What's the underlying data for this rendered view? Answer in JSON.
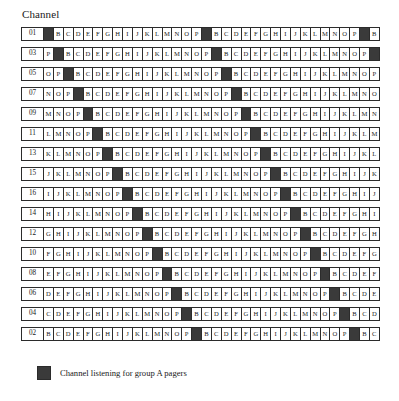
{
  "figure": {
    "axis_title": "Channel",
    "marked_symbol": "A",
    "marked_color": "#3a3a3a",
    "line_color": "#2b2b2b",
    "background_color": "#ffffff"
  },
  "legend": {
    "swatch_color": "#3a3a3a",
    "text": "Channel listening for group A pagers"
  },
  "chart_data": {
    "type": "table",
    "title": "Channel",
    "xlabel": "",
    "ylabel": "Channel",
    "slot_alphabet": [
      "A",
      "B",
      "C",
      "D",
      "E",
      "F",
      "G",
      "H",
      "I",
      "J",
      "K",
      "L",
      "M",
      "N",
      "O",
      "P"
    ],
    "marked_slot": "A",
    "row_order": [
      "01",
      "03",
      "05",
      "07",
      "09",
      "11",
      "13",
      "15",
      "16",
      "14",
      "12",
      "10",
      "08",
      "06",
      "04",
      "02"
    ],
    "rows": [
      {
        "channel": "01",
        "start_offset": 0,
        "slots": [
          "A",
          "B",
          "C",
          "D",
          "E",
          "F",
          "G",
          "H",
          "I",
          "J",
          "K",
          "L",
          "M",
          "N",
          "O",
          "P",
          "A",
          "B",
          "C",
          "D",
          "E",
          "F",
          "G",
          "H",
          "I",
          "J",
          "K",
          "L",
          "M",
          "N",
          "O",
          "P",
          "A",
          "B"
        ]
      },
      {
        "channel": "03",
        "start_offset": 15,
        "slots": [
          "P",
          "A",
          "B",
          "C",
          "D",
          "E",
          "F",
          "G",
          "H",
          "I",
          "J",
          "K",
          "L",
          "M",
          "N",
          "O",
          "P",
          "A",
          "B",
          "C",
          "D",
          "E",
          "F",
          "G",
          "H",
          "I",
          "J",
          "K",
          "L",
          "M",
          "N",
          "O",
          "P",
          "A"
        ]
      },
      {
        "channel": "05",
        "start_offset": 14,
        "slots": [
          "O",
          "P",
          "A",
          "B",
          "C",
          "D",
          "E",
          "F",
          "G",
          "H",
          "I",
          "J",
          "K",
          "L",
          "M",
          "N",
          "O",
          "P",
          "A",
          "B",
          "C",
          "D",
          "E",
          "F",
          "G",
          "H",
          "I",
          "J",
          "K",
          "L",
          "M",
          "N",
          "O",
          "P"
        ]
      },
      {
        "channel": "07",
        "start_offset": 13,
        "slots": [
          "N",
          "O",
          "P",
          "A",
          "B",
          "C",
          "D",
          "E",
          "F",
          "G",
          "H",
          "I",
          "J",
          "K",
          "L",
          "M",
          "N",
          "O",
          "P",
          "A",
          "B",
          "C",
          "D",
          "E",
          "F",
          "G",
          "H",
          "I",
          "J",
          "K",
          "L",
          "M",
          "N",
          "O"
        ]
      },
      {
        "channel": "09",
        "start_offset": 12,
        "slots": [
          "M",
          "N",
          "O",
          "P",
          "A",
          "B",
          "C",
          "D",
          "E",
          "F",
          "G",
          "H",
          "I",
          "J",
          "K",
          "L",
          "M",
          "N",
          "O",
          "P",
          "A",
          "B",
          "C",
          "D",
          "E",
          "F",
          "G",
          "H",
          "I",
          "J",
          "K",
          "L",
          "M",
          "N"
        ]
      },
      {
        "channel": "11",
        "start_offset": 11,
        "slots": [
          "L",
          "M",
          "N",
          "O",
          "P",
          "A",
          "B",
          "C",
          "D",
          "E",
          "F",
          "G",
          "H",
          "I",
          "J",
          "K",
          "L",
          "M",
          "N",
          "O",
          "P",
          "A",
          "B",
          "C",
          "D",
          "E",
          "F",
          "G",
          "H",
          "I",
          "J",
          "K",
          "L",
          "M"
        ]
      },
      {
        "channel": "13",
        "start_offset": 10,
        "slots": [
          "K",
          "L",
          "M",
          "N",
          "O",
          "P",
          "A",
          "B",
          "C",
          "D",
          "E",
          "F",
          "G",
          "H",
          "I",
          "J",
          "K",
          "L",
          "M",
          "N",
          "O",
          "P",
          "A",
          "B",
          "C",
          "D",
          "E",
          "F",
          "G",
          "H",
          "I",
          "J",
          "K",
          "L"
        ]
      },
      {
        "channel": "15",
        "start_offset": 9,
        "slots": [
          "J",
          "K",
          "L",
          "M",
          "N",
          "O",
          "P",
          "A",
          "B",
          "C",
          "D",
          "E",
          "F",
          "G",
          "H",
          "I",
          "J",
          "K",
          "L",
          "M",
          "N",
          "O",
          "P",
          "A",
          "B",
          "C",
          "D",
          "E",
          "F",
          "G",
          "H",
          "I",
          "J",
          "K"
        ]
      },
      {
        "channel": "16",
        "start_offset": 8,
        "slots": [
          "I",
          "J",
          "K",
          "L",
          "M",
          "N",
          "O",
          "P",
          "A",
          "B",
          "C",
          "D",
          "E",
          "F",
          "G",
          "H",
          "I",
          "J",
          "K",
          "L",
          "M",
          "N",
          "O",
          "P",
          "A",
          "B",
          "C",
          "D",
          "E",
          "F",
          "G",
          "H",
          "I",
          "J"
        ]
      },
      {
        "channel": "14",
        "start_offset": 7,
        "slots": [
          "H",
          "I",
          "J",
          "K",
          "L",
          "M",
          "N",
          "O",
          "P",
          "A",
          "B",
          "C",
          "D",
          "E",
          "F",
          "G",
          "H",
          "I",
          "J",
          "K",
          "L",
          "M",
          "N",
          "O",
          "P",
          "A",
          "B",
          "C",
          "D",
          "E",
          "F",
          "G",
          "H",
          "I"
        ]
      },
      {
        "channel": "12",
        "start_offset": 6,
        "slots": [
          "G",
          "H",
          "I",
          "J",
          "K",
          "L",
          "M",
          "N",
          "O",
          "P",
          "A",
          "B",
          "C",
          "D",
          "E",
          "F",
          "G",
          "H",
          "I",
          "J",
          "K",
          "L",
          "M",
          "N",
          "O",
          "P",
          "A",
          "B",
          "C",
          "D",
          "E",
          "F",
          "G",
          "H"
        ]
      },
      {
        "channel": "10",
        "start_offset": 5,
        "slots": [
          "F",
          "G",
          "H",
          "I",
          "J",
          "K",
          "L",
          "M",
          "N",
          "O",
          "P",
          "A",
          "B",
          "C",
          "D",
          "E",
          "F",
          "G",
          "H",
          "I",
          "J",
          "K",
          "L",
          "M",
          "N",
          "O",
          "P",
          "A",
          "B",
          "C",
          "D",
          "E",
          "F",
          "G"
        ]
      },
      {
        "channel": "08",
        "start_offset": 4,
        "slots": [
          "E",
          "F",
          "G",
          "H",
          "I",
          "J",
          "K",
          "L",
          "M",
          "N",
          "O",
          "P",
          "A",
          "B",
          "C",
          "D",
          "E",
          "F",
          "G",
          "H",
          "I",
          "J",
          "K",
          "L",
          "M",
          "N",
          "O",
          "P",
          "A",
          "B",
          "C",
          "D",
          "E",
          "F"
        ]
      },
      {
        "channel": "06",
        "start_offset": 3,
        "slots": [
          "D",
          "E",
          "F",
          "G",
          "H",
          "I",
          "J",
          "K",
          "L",
          "M",
          "N",
          "O",
          "P",
          "A",
          "B",
          "C",
          "D",
          "E",
          "F",
          "G",
          "H",
          "I",
          "J",
          "K",
          "L",
          "M",
          "N",
          "O",
          "P",
          "A",
          "B",
          "C",
          "D",
          "E"
        ]
      },
      {
        "channel": "04",
        "start_offset": 2,
        "slots": [
          "C",
          "D",
          "E",
          "F",
          "G",
          "H",
          "I",
          "J",
          "K",
          "L",
          "M",
          "N",
          "O",
          "P",
          "A",
          "B",
          "C",
          "D",
          "E",
          "F",
          "G",
          "H",
          "I",
          "J",
          "K",
          "L",
          "M",
          "N",
          "O",
          "P",
          "A",
          "B",
          "C",
          "D"
        ]
      },
      {
        "channel": "02",
        "start_offset": 1,
        "slots": [
          "B",
          "C",
          "D",
          "E",
          "F",
          "G",
          "H",
          "I",
          "J",
          "K",
          "L",
          "M",
          "N",
          "O",
          "P",
          "A",
          "B",
          "C",
          "D",
          "E",
          "F",
          "G",
          "H",
          "I",
          "J",
          "K",
          "L",
          "M",
          "N",
          "O",
          "P",
          "A",
          "B",
          "C"
        ]
      }
    ]
  }
}
